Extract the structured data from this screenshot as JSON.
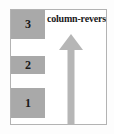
{
  "diagram": {
    "title": "column-reverse",
    "label": "column-reverse",
    "direction": "up",
    "container": {
      "name": "flex-container",
      "border_color": "#b3b3b3",
      "background": "#ffffff"
    },
    "items": [
      {
        "label": "3",
        "order_position": "top"
      },
      {
        "label": "2",
        "order_position": "middle"
      },
      {
        "label": "1",
        "order_position": "bottom"
      }
    ],
    "item_color": "#a9a9a9",
    "item_text_color": "#1a1a1a",
    "arrow": {
      "name": "up-arrow",
      "color": "#b5b5b5",
      "points": "up"
    }
  }
}
